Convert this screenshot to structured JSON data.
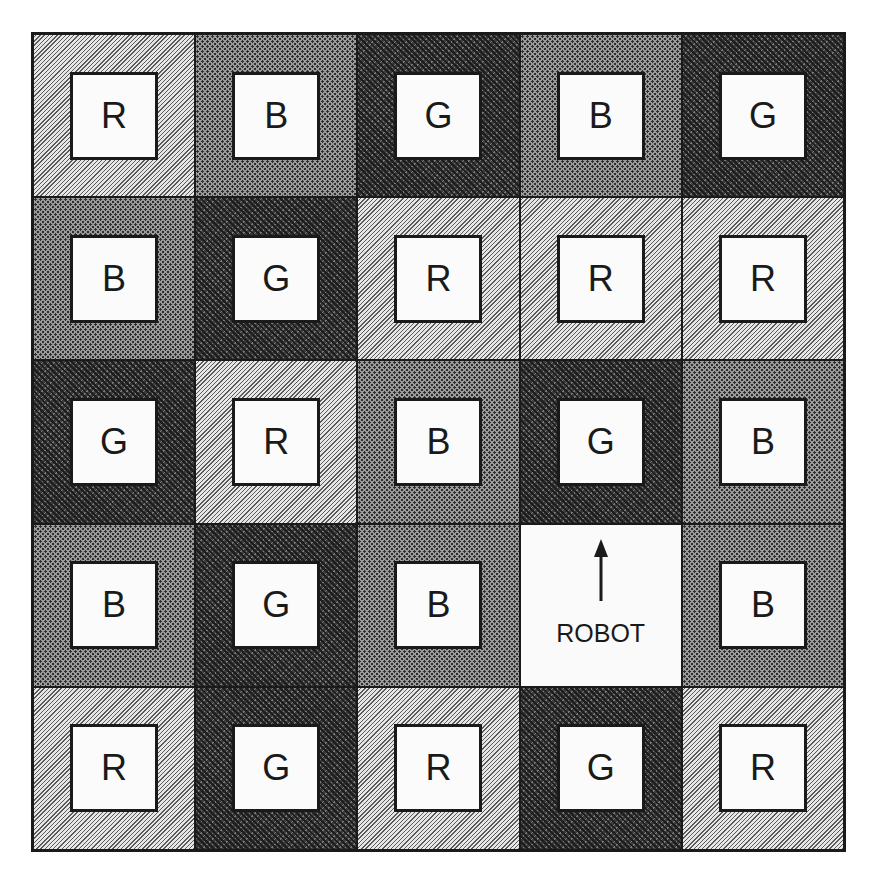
{
  "diagram": {
    "type": "grid-world",
    "rows": 5,
    "cols": 5,
    "legend_patterns": {
      "R": "light-diagonal-hatch",
      "B": "medium-dot-checker",
      "G": "dark-woven"
    },
    "grid": [
      [
        "R",
        "B",
        "G",
        "B",
        "G"
      ],
      [
        "B",
        "G",
        "R",
        "R",
        "R"
      ],
      [
        "G",
        "R",
        "B",
        "G",
        "B"
      ],
      [
        "B",
        "G",
        "B",
        "ROBOT",
        "B"
      ],
      [
        "R",
        "G",
        "R",
        "G",
        "R"
      ]
    ],
    "cells": [
      {
        "row": 0,
        "col": 0,
        "label": "R"
      },
      {
        "row": 0,
        "col": 1,
        "label": "B"
      },
      {
        "row": 0,
        "col": 2,
        "label": "G"
      },
      {
        "row": 0,
        "col": 3,
        "label": "B"
      },
      {
        "row": 0,
        "col": 4,
        "label": "G"
      },
      {
        "row": 1,
        "col": 0,
        "label": "B"
      },
      {
        "row": 1,
        "col": 1,
        "label": "G"
      },
      {
        "row": 1,
        "col": 2,
        "label": "R"
      },
      {
        "row": 1,
        "col": 3,
        "label": "R"
      },
      {
        "row": 1,
        "col": 4,
        "label": "R"
      },
      {
        "row": 2,
        "col": 0,
        "label": "G"
      },
      {
        "row": 2,
        "col": 1,
        "label": "R"
      },
      {
        "row": 2,
        "col": 2,
        "label": "B"
      },
      {
        "row": 2,
        "col": 3,
        "label": "G"
      },
      {
        "row": 2,
        "col": 4,
        "label": "B"
      },
      {
        "row": 3,
        "col": 0,
        "label": "B"
      },
      {
        "row": 3,
        "col": 1,
        "label": "G"
      },
      {
        "row": 3,
        "col": 2,
        "label": "B"
      },
      {
        "row": 3,
        "col": 3,
        "label": "ROBOT",
        "robot": true,
        "heading": "up"
      },
      {
        "row": 3,
        "col": 4,
        "label": "B"
      },
      {
        "row": 4,
        "col": 0,
        "label": "R"
      },
      {
        "row": 4,
        "col": 1,
        "label": "G"
      },
      {
        "row": 4,
        "col": 2,
        "label": "R"
      },
      {
        "row": 4,
        "col": 3,
        "label": "G"
      },
      {
        "row": 4,
        "col": 4,
        "label": "R"
      }
    ],
    "robot": {
      "label": "ROBOT",
      "row": 3,
      "col": 3,
      "heading": "up",
      "icon": "arrow-up-icon"
    }
  }
}
